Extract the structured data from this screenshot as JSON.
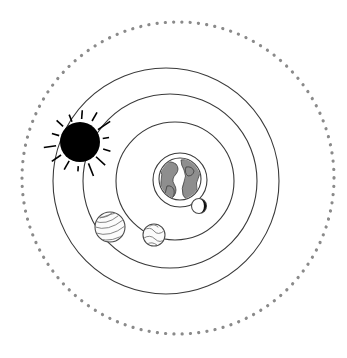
{
  "scene": {
    "title": "Geocentric Solar System Diagram",
    "center_label": "Earth",
    "background_color": "#ffffff",
    "width": 347,
    "height": 358
  },
  "center_body": {
    "name": "earth",
    "label": "Earth",
    "cx": 180,
    "cy": 179,
    "r": 21,
    "ocean_color": "#ffffff",
    "land_color": "#8e8e8e",
    "outline_color": "#3d3d3d"
  },
  "satellite": {
    "name": "moon",
    "label": "Moon",
    "cx": 199,
    "cy": 206,
    "r": 7.5,
    "phase": "crescent",
    "lit_color": "#ffffff",
    "dark_color": "#111111"
  },
  "star": {
    "name": "sun",
    "label": "Sun",
    "cx": 80,
    "cy": 142,
    "r": 20,
    "core_color": "#000000",
    "ray_count": 14,
    "ray_inner": 23,
    "ray_outer": 33
  },
  "planets": [
    {
      "name": "planet-striped",
      "label": "Jupiter",
      "cx": 110,
      "cy": 227,
      "r": 15,
      "face_color": "#fbfbfb",
      "band_color": "#6f6f6f",
      "pattern": "bands"
    },
    {
      "name": "planet-mottled",
      "label": "Venus",
      "cx": 154,
      "cy": 235,
      "r": 11,
      "face_color": "#fbfbfb",
      "band_color": "#6f6f6f",
      "pattern": "mottled"
    }
  ],
  "orbits": [
    {
      "name": "orbit-1",
      "label": "Inner orbit",
      "cx": 180,
      "cy": 180,
      "r": 27,
      "style": "solid",
      "color": "#3a3a3a"
    },
    {
      "name": "orbit-2",
      "label": "Second orbit",
      "cx": 175,
      "cy": 181,
      "r": 59,
      "style": "solid",
      "color": "#3a3a3a"
    },
    {
      "name": "orbit-3",
      "label": "Third orbit",
      "cx": 170,
      "cy": 181,
      "r": 87,
      "style": "solid",
      "color": "#3a3a3a"
    },
    {
      "name": "orbit-4",
      "label": "Outer orbit",
      "cx": 166,
      "cy": 181,
      "r": 113,
      "style": "solid",
      "color": "#3a3a3a"
    },
    {
      "name": "orbit-boundary",
      "label": "Celestial sphere",
      "cx": 178,
      "cy": 178,
      "r": 156,
      "style": "dashed",
      "color": "#8a8a8a"
    }
  ]
}
